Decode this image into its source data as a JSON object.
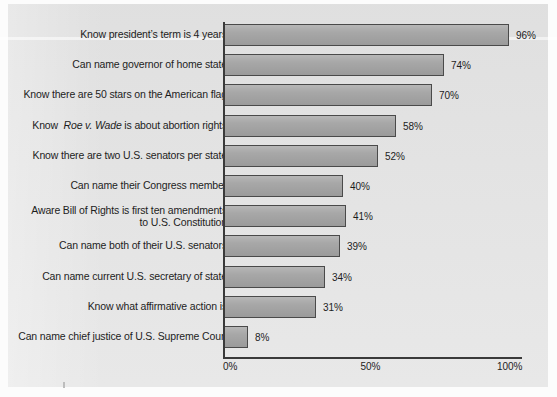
{
  "chart_data": {
    "type": "bar",
    "orientation": "horizontal",
    "title": "",
    "subtitle": "",
    "xlabel": "",
    "ylabel": "",
    "xlim": [
      0,
      100
    ],
    "grid": false,
    "legend": false,
    "value_suffix": "%",
    "categories": [
      "Know president’s term is 4 years",
      "Can name governor of home state",
      "Know there are 50 stars on the American flag",
      "Know  Roe v. Wade is about abortion rights",
      "Know there are two U.S. senators per state",
      "Can name their Congress member",
      "Aware Bill of Rights is first ten amendments to U.S. Constitution",
      "Can name both of their U.S. senators",
      "Can name current U.S. secretary of state",
      "Know what affirmative action is",
      "Can name chief justice of U.S. Supreme Court"
    ],
    "values": [
      96,
      74,
      70,
      58,
      52,
      40,
      41,
      39,
      34,
      31,
      8
    ],
    "value_labels": [
      "96%",
      "74%",
      "70%",
      "58%",
      "52%",
      "40%",
      "41%",
      "39%",
      "34%",
      "31%",
      "8%"
    ],
    "xticks": [
      0,
      50,
      100
    ],
    "xtick_labels": [
      "0%",
      "50%",
      "100%"
    ]
  },
  "rows": [
    {
      "label_html": "Know president’s term is 4 years",
      "label_plain": "Know president’s term is 4 years",
      "value": 96,
      "value_label": "96%"
    },
    {
      "label_html": "Can name governor of home state",
      "label_plain": "Can name governor of home state",
      "value": 74,
      "value_label": "74%"
    },
    {
      "label_html": "Know there are 50 stars on the American flag",
      "label_plain": "Know there are 50 stars on the American flag",
      "value": 70,
      "value_label": "70%"
    },
    {
      "label_html": "Know&nbsp; <i class=\"ital\">Roe v. Wade</i> is about abortion rights",
      "label_plain": "Know  Roe v. Wade is about abortion rights",
      "value": 58,
      "value_label": "58%"
    },
    {
      "label_html": "Know there are two U.S. senators per state",
      "label_plain": "Know there are two U.S. senators per state",
      "value": 52,
      "value_label": "52%"
    },
    {
      "label_html": "Can name their Congress member",
      "label_plain": "Can name their Congress member",
      "value": 40,
      "value_label": "40%"
    },
    {
      "label_html": "Aware Bill of Rights is first ten amendments<br>to U.S. Constitution",
      "label_plain": "Aware Bill of Rights is first ten amendments to U.S. Constitution",
      "value": 41,
      "value_label": "41%"
    },
    {
      "label_html": "Can name both of their U.S. senators",
      "label_plain": "Can name both of their U.S. senators",
      "value": 39,
      "value_label": "39%"
    },
    {
      "label_html": "Can name current U.S. secretary of state",
      "label_plain": "Can name current U.S. secretary of state",
      "value": 34,
      "value_label": "34%"
    },
    {
      "label_html": "Know what affirmative action is",
      "label_plain": "Know what affirmative action is",
      "value": 31,
      "value_label": "31%"
    },
    {
      "label_html": "Can name chief justice of U.S. Supreme Court",
      "label_plain": "Can name chief justice of U.S. Supreme Court",
      "value": 8,
      "value_label": "8%"
    }
  ],
  "axis": {
    "ticks": [
      {
        "value": 0,
        "label": "0%"
      },
      {
        "value": 50,
        "label": "50%"
      },
      {
        "value": 100,
        "label": "100%"
      }
    ]
  },
  "colors": {
    "panel_background": "#e3e3e3",
    "page_background": "#fcfcfc",
    "bar_fill": "#a3a3a3",
    "bar_border": "#4a4a4a",
    "axis_line": "#3a3a3a",
    "text": "#1d1d1d"
  },
  "layout": {
    "plot_left_px": 224,
    "plot_width_px": 297,
    "first_row_top_px": 24,
    "row_pitch_px": 30.2,
    "bar_height_px": 22
  }
}
